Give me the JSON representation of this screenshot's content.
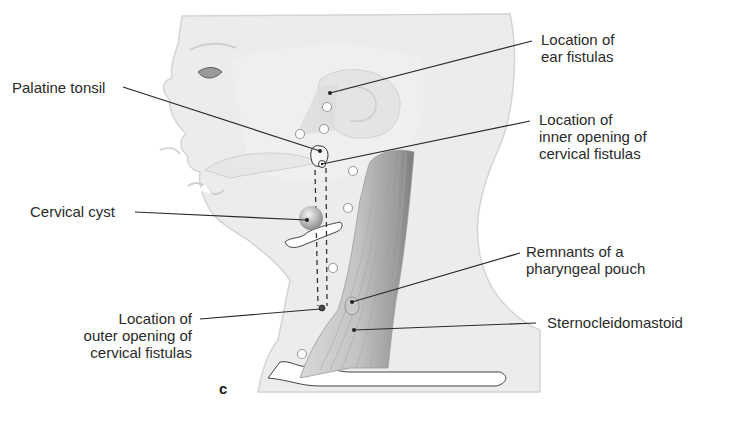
{
  "figure": {
    "panel_letter": "c",
    "labels": {
      "ear_fistulas": "Location of\near fistulas",
      "palatine_tonsil": "Palatine tonsil",
      "inner_opening": "Location of\ninner opening of\ncervical fistulas",
      "cervical_cyst": "Cervical cyst",
      "pharyngeal_pouch": "Remnants of a\npharyngeal pouch",
      "outer_opening": "Location of\nouter opening of\ncervical fistulas",
      "sternocleidomastoid": "Sternocleidomastoid"
    },
    "colors": {
      "skin": "#ececec",
      "skin_edge": "#d4d4d4",
      "muscle": "#b9b9b9",
      "muscle_dark": "#8a8a8a",
      "leader_line": "#2a2a2a",
      "text": "#2a2a2a"
    }
  }
}
